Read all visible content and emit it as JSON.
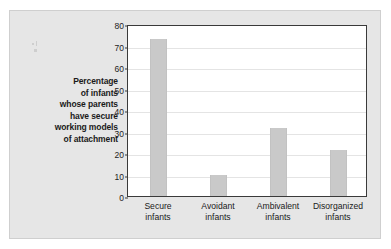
{
  "chart_data": {
    "type": "bar",
    "title": "",
    "subtitle": "",
    "xlabel": "",
    "ylabel": "Percentage of infants whose parents have secure working models of attachment",
    "ylabel_lines": [
      "Percentage",
      "of infants",
      "whose parents",
      "have secure",
      "working models",
      "of attachment"
    ],
    "categories": [
      "Secure infants",
      "Avoidant infants",
      "Ambivalent infants",
      "Disorganized infants"
    ],
    "category_lines": [
      [
        "Secure",
        "infants"
      ],
      [
        "Avoidant",
        "infants"
      ],
      [
        "Ambivalent",
        "infants"
      ],
      [
        "Disorganized",
        "infants"
      ]
    ],
    "values": [
      73,
      9.8,
      31.5,
      21.5
    ],
    "ylim": [
      0,
      80
    ],
    "ytick_step": 10,
    "yticks": [
      0,
      10,
      20,
      30,
      40,
      50,
      60,
      70,
      80
    ],
    "ytick_labels": [
      "0",
      "10",
      "20",
      "30",
      "40",
      "50",
      "60",
      "70",
      "80"
    ],
    "grid": true,
    "legend": false,
    "legend_position": "none",
    "bar_color": "#c9c9c9",
    "plot_background": "#ffffff",
    "panel_background": "#e6e6e6",
    "axis_color": "#3a3a3a",
    "gridline_color": "#e4e4e4",
    "text_color": "#1a1a1a"
  }
}
